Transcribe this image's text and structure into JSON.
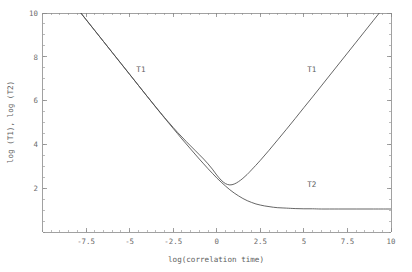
{
  "figure": {
    "background_color": "#ffffff",
    "axis_color": "#8a8a8a",
    "curve_color": "#4a4a4a",
    "text_color": "#5e5e5e"
  },
  "chart_data": {
    "type": "line",
    "title": "",
    "xlabel": "log(correlation time)",
    "ylabel": "log (T1), log (T2)",
    "xlim": [
      -10,
      10
    ],
    "ylim": [
      0,
      10
    ],
    "grid": false,
    "legend_position": "inline-annotations",
    "xticks": [
      -7.5,
      -5,
      -2.5,
      0,
      2.5,
      5,
      7.5,
      10
    ],
    "xtick_labels": [
      "-7.5",
      "-5",
      "-2.5",
      "0",
      "2.5",
      "5",
      "7.5",
      "10"
    ],
    "yticks": [
      2,
      4,
      6,
      8,
      10
    ],
    "ytick_labels": [
      "2",
      "4",
      "6",
      "8",
      "10"
    ],
    "x_minor_step": 0.5,
    "y_minor_step": 0.5,
    "annotations": [
      {
        "text": "T1",
        "x": -4.35,
        "y": 7.32
      },
      {
        "text": "T1",
        "x": 5.45,
        "y": 7.32
      },
      {
        "text": "T2",
        "x": 5.45,
        "y": 2.05
      }
    ],
    "series": [
      {
        "name": "T1",
        "label": "T1",
        "x": [
          -10,
          -9.5,
          -9,
          -8.5,
          -8,
          -7.5,
          -7,
          -6.5,
          -6,
          -5.5,
          -5,
          -4.5,
          -4,
          -3.5,
          -3,
          -2.75,
          -2.5,
          -2.25,
          -2,
          -1.75,
          -1.5,
          -1.25,
          -1,
          -0.75,
          -0.5,
          -0.25,
          0,
          0.25,
          0.5,
          0.75,
          1,
          1.25,
          1.5,
          1.75,
          2,
          2.5,
          3,
          3.5,
          4,
          4.5,
          5,
          5.5,
          6,
          6.5,
          7,
          7.5,
          8,
          8.5,
          9,
          9.5,
          10
        ],
        "y": [
          12.2,
          11.7,
          11.2,
          10.7,
          10.2,
          9.7,
          9.2,
          8.7,
          8.2,
          7.7,
          7.2,
          6.7,
          6.2,
          5.71,
          5.23,
          5.0,
          4.77,
          4.55,
          4.34,
          4.13,
          3.93,
          3.73,
          3.53,
          3.33,
          3.11,
          2.87,
          2.6,
          2.37,
          2.21,
          2.15,
          2.19,
          2.3,
          2.45,
          2.63,
          2.84,
          3.27,
          3.73,
          4.21,
          4.69,
          5.18,
          5.68,
          6.17,
          6.67,
          7.17,
          7.67,
          8.17,
          8.67,
          9.17,
          9.67,
          10.17,
          10.67
        ]
      },
      {
        "name": "T2",
        "label": "T2",
        "x": [
          -10,
          -9.5,
          -9,
          -8.5,
          -8,
          -7.5,
          -7,
          -6.5,
          -6,
          -5.5,
          -5,
          -4.5,
          -4,
          -3.5,
          -3,
          -2.75,
          -2.5,
          -2.25,
          -2,
          -1.75,
          -1.5,
          -1.25,
          -1,
          -0.75,
          -0.5,
          -0.25,
          0,
          0.25,
          0.5,
          0.75,
          1,
          1.25,
          1.5,
          1.75,
          2,
          2.25,
          2.5,
          2.75,
          3,
          3.25,
          3.5,
          3.75,
          4,
          4.5,
          5,
          5.5,
          6,
          7,
          8,
          9,
          10
        ],
        "y": [
          12.2,
          11.7,
          11.2,
          10.7,
          10.2,
          9.7,
          9.2,
          8.7,
          8.2,
          7.7,
          7.2,
          6.7,
          6.2,
          5.7,
          5.21,
          4.97,
          4.73,
          4.49,
          4.25,
          4.02,
          3.79,
          3.56,
          3.33,
          3.11,
          2.89,
          2.68,
          2.47,
          2.28,
          2.1,
          1.93,
          1.78,
          1.65,
          1.53,
          1.43,
          1.35,
          1.28,
          1.23,
          1.19,
          1.16,
          1.13,
          1.11,
          1.1,
          1.09,
          1.07,
          1.06,
          1.06,
          1.05,
          1.05,
          1.05,
          1.05,
          1.05
        ]
      }
    ]
  }
}
